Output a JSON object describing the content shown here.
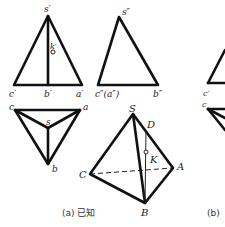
{
  "figure": {
    "front_view": {
      "labels": {
        "s": "s′",
        "k": "k′",
        "c": "c′",
        "b": "b′",
        "a": "a′"
      }
    },
    "side_view": {
      "labels": {
        "s": "s″",
        "ca": "c″(a″)",
        "b": "b″"
      }
    },
    "top_view": {
      "labels": {
        "c": "c",
        "a": "a",
        "s": "s",
        "b": "b"
      }
    },
    "pictorial": {
      "labels": {
        "S": "S",
        "D": "D",
        "K": "K",
        "A": "A",
        "C": "C",
        "B": "B"
      }
    },
    "partial_b": {
      "labels": {
        "c_front": "c′",
        "c_top": "c"
      }
    },
    "captions": {
      "a": "(a) 已知",
      "b": "(b)"
    }
  }
}
